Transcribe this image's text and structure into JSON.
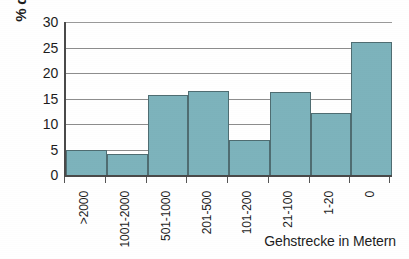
{
  "chart_data": {
    "type": "bar",
    "title": "",
    "xlabel": "Gehstrecke in Metern",
    "ylabel": "% der Patienten",
    "categories": [
      ">2000",
      "1001-2000",
      "501-1000",
      "201-500",
      "101-200",
      "21-100",
      "1-20",
      "0"
    ],
    "values": [
      5.0,
      4.2,
      15.6,
      16.5,
      6.8,
      16.3,
      12.1,
      26.1
    ],
    "ylim": [
      0,
      30
    ],
    "yticks": [
      0,
      5,
      10,
      15,
      20,
      25,
      30
    ],
    "ytick_labels": [
      "0",
      "5",
      "10",
      "15",
      "20",
      "25",
      "30"
    ],
    "grid": true,
    "legend": false,
    "bar_color": "#7db3bc",
    "bar_border_color": "#4f6d72",
    "axis_color": "#4a4a4a",
    "gridline_color": "#8d8d8d"
  }
}
